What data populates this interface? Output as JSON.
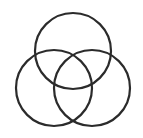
{
  "diagram": {
    "type": "venn",
    "stroke_color": "#2b2b2b",
    "background": "#ffffff",
    "stroke_width": 2.2,
    "circles": [
      {
        "name": "top",
        "cx": 73,
        "cy": 51,
        "r": 38
      },
      {
        "name": "left",
        "cx": 54,
        "cy": 88,
        "r": 38
      },
      {
        "name": "right",
        "cx": 92,
        "cy": 88,
        "r": 38
      }
    ]
  }
}
